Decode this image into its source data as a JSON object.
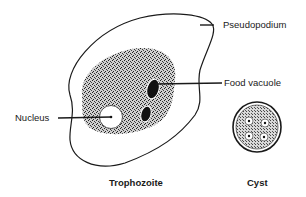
{
  "diagram": {
    "labels": {
      "pseudopodium": "Pseudopodium",
      "food_vacuole": "Food vacuole",
      "nucleus": "Nucleus"
    },
    "captions": {
      "trophozoite": "Trophozoite",
      "cyst": "Cyst"
    },
    "colors": {
      "ink": "#1a1a1a",
      "background": "#ffffff",
      "stipple": "#555555"
    }
  }
}
